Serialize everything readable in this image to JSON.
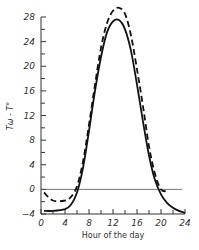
{
  "chart_data": {
    "type": "line",
    "title": "",
    "xlabel": "Hour of the day",
    "ylabel": "Tω - T°",
    "xlim": [
      0,
      24
    ],
    "ylim": [
      -4,
      28
    ],
    "x_ticks": [
      0,
      4,
      8,
      12,
      16,
      20,
      24
    ],
    "y_ticks": [
      -4,
      0,
      4,
      8,
      12,
      16,
      20,
      24,
      28
    ],
    "grid": false,
    "legend": null,
    "reference_line": {
      "y": 0,
      "from_x": 0,
      "to_x": 23.5
    },
    "x": [
      0.5,
      2,
      4,
      5,
      6,
      7,
      8,
      9,
      10,
      11,
      12,
      13,
      14,
      15,
      16,
      17,
      18,
      19,
      20,
      21,
      22,
      23,
      24
    ],
    "series": [
      {
        "name": "solid",
        "style": "solid",
        "values": [
          -3.5,
          -3.5,
          -3.2,
          -2.5,
          -0.5,
          3.5,
          9.5,
          16,
          21.5,
          25.5,
          27.3,
          27.5,
          26,
          22.5,
          17,
          11,
          5.5,
          1.5,
          -0.8,
          -2.2,
          -3,
          -3.5,
          -3.8
        ]
      },
      {
        "name": "dashed",
        "style": "dashed",
        "values": [
          -0.5,
          -1.8,
          -1.8,
          -1.2,
          0.5,
          4.5,
          10.5,
          17,
          23,
          27,
          29,
          29.5,
          28.5,
          25,
          19.5,
          13.5,
          7,
          2.5,
          0,
          -0.3,
          null,
          null,
          null
        ]
      }
    ]
  }
}
